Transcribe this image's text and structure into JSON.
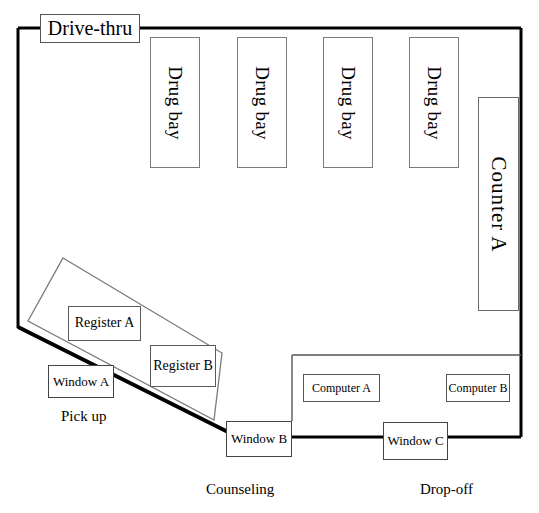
{
  "diagram": {
    "stroke_color": "#000000",
    "box_border_color": "#666666",
    "background": "#ffffff"
  },
  "rooms": {
    "drive_thru": {
      "label": "Drive-thru"
    },
    "counter_a": {
      "label": "Counter  A"
    },
    "drug_bays": [
      {
        "label": "Drug bay"
      },
      {
        "label": "Drug bay"
      },
      {
        "label": "Drug bay"
      },
      {
        "label": "Drug bay"
      }
    ],
    "register_a": {
      "label": "Register  A"
    },
    "register_b": {
      "label": "Register B"
    },
    "computer_a": {
      "label": "Computer A"
    },
    "computer_b": {
      "label": "Computer B"
    }
  },
  "windows": {
    "window_a": {
      "label": "Window  A"
    },
    "window_b": {
      "label": "Window  B"
    },
    "window_c": {
      "label": "Window C"
    }
  },
  "area_labels": {
    "pick_up": "Pick up",
    "counseling": "Counseling",
    "drop_off": "Drop-off"
  }
}
